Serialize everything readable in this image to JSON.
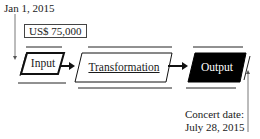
{
  "start": {
    "date_label": "Jan 1, 2015"
  },
  "budget": {
    "value_label": "US$ 75,000"
  },
  "nodes": [
    {
      "id": "input",
      "label": "Input",
      "style": "thick-outline",
      "fill": "#ffffff",
      "text_color": "#1a1a1a"
    },
    {
      "id": "transformation",
      "label": "Transformation",
      "style": "thin-outline-underlined",
      "fill": "#ffffff",
      "text_color": "#1a1a1a"
    },
    {
      "id": "output",
      "label": "Output",
      "style": "filled",
      "fill": "#000000",
      "text_color": "#ffffff"
    }
  ],
  "end": {
    "caption_line1": "Concert date:",
    "caption_line2": "July 28, 2015"
  },
  "colors": {
    "line": "#222222",
    "output_fill": "#000000",
    "background": "#ffffff"
  }
}
